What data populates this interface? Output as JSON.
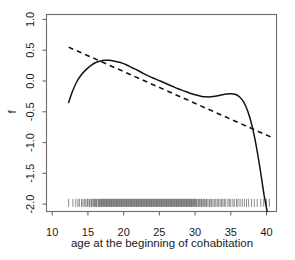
{
  "chart_data": {
    "type": "line",
    "title": "",
    "xlabel": "age at the beginning of cohabitation",
    "ylabel": "f",
    "xlim": [
      9.2,
      41.4
    ],
    "ylim": [
      -2.12,
      1.08
    ],
    "xticks": [
      10,
      15,
      20,
      25,
      30,
      35,
      40
    ],
    "xtick_labels": [
      "10",
      "15",
      "20",
      "25",
      "30",
      "35",
      "40"
    ],
    "yticks": [
      1.0,
      0.5,
      0.0,
      -0.5,
      -1.0,
      -1.5,
      -2.0
    ],
    "ytick_labels": [
      "1.0",
      "0.5",
      "0.0",
      "-0.5",
      "-1.0",
      "-1.5",
      "-2.0"
    ],
    "grid": false,
    "legend": "none",
    "series": [
      {
        "name": "smooth-fit",
        "style": "solid",
        "color": "#141414",
        "x": [
          12.3,
          12.8,
          13.4,
          14.0,
          14.7,
          15.4,
          16.1,
          16.8,
          17.4,
          18.0,
          18.6,
          19.2,
          19.8,
          20.5,
          21.2,
          22.0,
          22.8,
          23.6,
          24.4,
          25.2,
          26.0,
          26.8,
          27.6,
          28.4,
          29.2,
          30.0,
          30.8,
          31.5,
          32.2,
          33.0,
          33.8,
          34.4,
          35.0,
          35.6,
          36.2,
          36.8,
          37.4,
          38.0,
          38.6,
          39.2,
          39.7,
          40.1
        ],
        "y": [
          -0.35,
          -0.18,
          -0.02,
          0.09,
          0.18,
          0.25,
          0.3,
          0.325,
          0.335,
          0.335,
          0.325,
          0.31,
          0.29,
          0.255,
          0.215,
          0.17,
          0.12,
          0.075,
          0.035,
          -0.005,
          -0.045,
          -0.085,
          -0.125,
          -0.16,
          -0.195,
          -0.225,
          -0.248,
          -0.258,
          -0.258,
          -0.245,
          -0.225,
          -0.213,
          -0.208,
          -0.215,
          -0.255,
          -0.34,
          -0.5,
          -0.74,
          -1.08,
          -1.5,
          -1.88,
          -2.12
        ]
      },
      {
        "name": "linear-fit",
        "style": "dashed",
        "color": "#141414",
        "x": [
          12.3,
          41.0
        ],
        "y": [
          0.55,
          -0.93
        ]
      }
    ],
    "rug": {
      "name": "data-rug",
      "position": "bottom",
      "y_value": -2.02,
      "values": [
        12.3,
        12.9,
        13.3,
        13.6,
        13.8,
        14.1,
        14.3,
        14.5,
        14.7,
        14.9,
        15.0,
        15.2,
        15.3,
        15.5,
        15.6,
        15.8,
        15.9,
        16.0,
        16.1,
        16.2,
        16.4,
        16.5,
        16.6,
        16.7,
        16.8,
        16.9,
        17.0,
        17.1,
        17.2,
        17.3,
        17.4,
        17.5,
        17.6,
        17.7,
        17.8,
        17.9,
        18.0,
        18.1,
        18.2,
        18.3,
        18.4,
        18.5,
        18.6,
        18.7,
        18.8,
        18.9,
        19.0,
        19.1,
        19.2,
        19.3,
        19.4,
        19.5,
        19.6,
        19.7,
        19.8,
        19.9,
        20.0,
        20.1,
        20.2,
        20.3,
        20.4,
        20.5,
        20.6,
        20.7,
        20.8,
        20.9,
        21.0,
        21.1,
        21.2,
        21.3,
        21.4,
        21.5,
        21.6,
        21.7,
        21.8,
        21.9,
        22.0,
        22.1,
        22.2,
        22.3,
        22.4,
        22.5,
        22.6,
        22.7,
        22.8,
        22.9,
        23.0,
        23.1,
        23.2,
        23.3,
        23.4,
        23.5,
        23.6,
        23.7,
        23.8,
        23.9,
        24.0,
        24.1,
        24.2,
        24.3,
        24.4,
        24.5,
        24.6,
        24.7,
        24.8,
        24.9,
        25.0,
        25.1,
        25.2,
        25.3,
        25.4,
        25.5,
        25.6,
        25.7,
        25.8,
        25.9,
        26.0,
        26.1,
        26.2,
        26.3,
        26.4,
        26.5,
        26.6,
        26.7,
        26.8,
        26.9,
        27.0,
        27.1,
        27.2,
        27.3,
        27.4,
        27.5,
        27.6,
        27.7,
        27.8,
        27.9,
        28.0,
        28.1,
        28.2,
        28.3,
        28.4,
        28.5,
        28.6,
        28.7,
        28.8,
        28.9,
        29.0,
        29.1,
        29.2,
        29.3,
        29.4,
        29.5,
        29.6,
        29.7,
        29.8,
        29.9,
        30.0,
        30.1,
        30.2,
        30.4,
        30.5,
        30.6,
        30.8,
        30.9,
        31.0,
        31.2,
        31.3,
        31.5,
        31.6,
        31.8,
        32.0,
        32.1,
        32.3,
        32.5,
        32.7,
        32.9,
        33.1,
        33.3,
        33.5,
        33.7,
        33.9,
        34.1,
        34.3,
        34.6,
        34.8,
        35.0,
        35.3,
        35.5,
        35.8,
        36.0,
        36.3,
        36.6,
        36.9,
        37.2,
        37.5,
        37.9,
        38.3,
        38.7,
        39.2,
        39.6,
        40.0,
        40.4
      ]
    }
  },
  "axes": {
    "y_axis_title": "f",
    "x_axis_title": "age at the beginning of cohabitation"
  }
}
